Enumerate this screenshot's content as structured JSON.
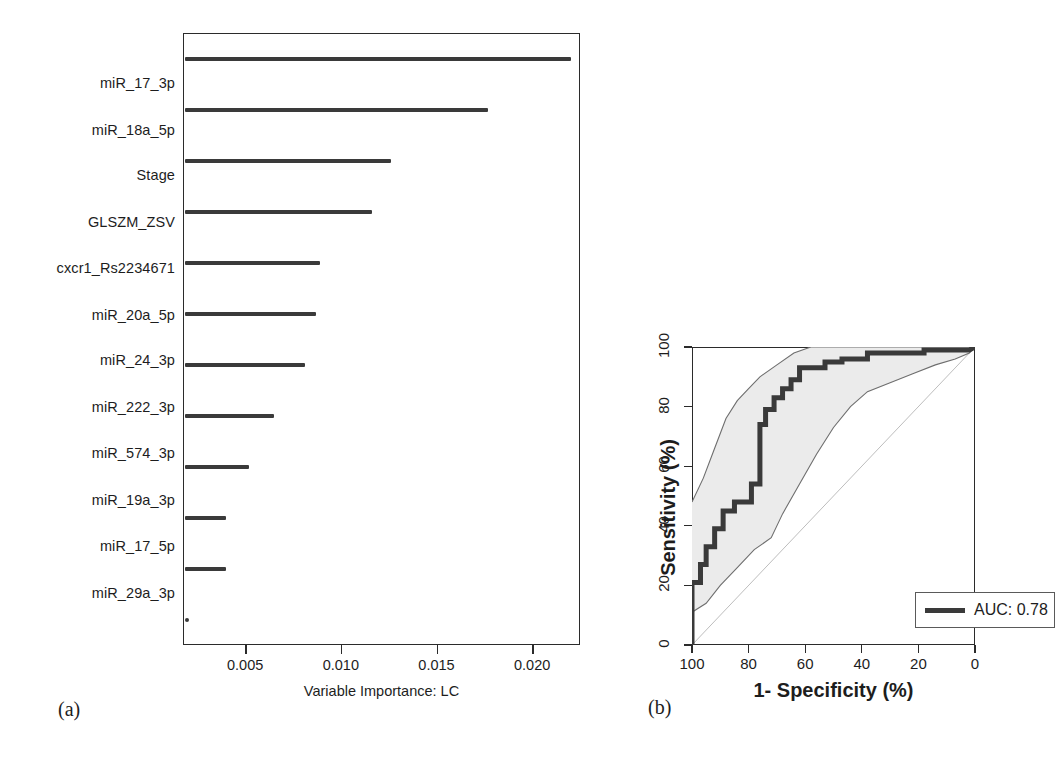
{
  "figure": {
    "caption_a": "(a)",
    "caption_b": "(b)"
  },
  "chart_data": [
    {
      "type": "bar",
      "orientation": "horizontal",
      "title": "",
      "xlabel": "Variable Importance: LC",
      "ylabel": "",
      "xlim": [
        0.00175,
        0.0225
      ],
      "xticks": [
        "0.005",
        "0.010",
        "0.015",
        "0.020"
      ],
      "xtick_values": [
        0.005,
        0.01,
        0.015,
        0.02
      ],
      "grid": false,
      "legend": "none",
      "categories": [
        "miR_17_3p",
        "miR_18a_5p",
        "Stage",
        "GLSZM_ZSV",
        "cxcr1_Rs2234671",
        "miR_20a_5p",
        "miR_24_3p",
        "miR_222_3p",
        "miR_574_3p",
        "miR_19a_3p",
        "miR_17_5p",
        "miR_29a_3p"
      ],
      "values": [
        0.0219,
        0.0176,
        0.0125,
        0.0115,
        0.0088,
        0.0086,
        0.008,
        0.0064,
        0.0051,
        0.0039,
        0.0039,
        0.0019
      ]
    },
    {
      "type": "line",
      "subtype": "roc",
      "title": "",
      "xlabel": "1- Specificity (%)",
      "ylabel": "Sensitivity (%)",
      "xlim": [
        100,
        0
      ],
      "ylim": [
        0,
        100
      ],
      "xticks": [
        "100",
        "80",
        "60",
        "40",
        "20",
        "0"
      ],
      "xtick_values": [
        100,
        80,
        60,
        40,
        20,
        0
      ],
      "yticks": [
        "100",
        "80",
        "60",
        "40",
        "20",
        "0"
      ],
      "ytick_values": [
        100,
        80,
        60,
        40,
        20,
        0
      ],
      "grid": false,
      "legend_position": "bottom-right",
      "legend_entries": [
        "AUC: 0.78"
      ],
      "auc": "0.78",
      "series": [
        {
          "name": "ROC curve",
          "points": [
            [
              100,
              0
            ],
            [
              100,
              21
            ],
            [
              97,
              21
            ],
            [
              97,
              27
            ],
            [
              95,
              27
            ],
            [
              95,
              33
            ],
            [
              92,
              33
            ],
            [
              92,
              39
            ],
            [
              89,
              39
            ],
            [
              89,
              45
            ],
            [
              85,
              45
            ],
            [
              85,
              48
            ],
            [
              79,
              48
            ],
            [
              79,
              54
            ],
            [
              76,
              54
            ],
            [
              76,
              74
            ],
            [
              74,
              74
            ],
            [
              74,
              79
            ],
            [
              71,
              79
            ],
            [
              71,
              83
            ],
            [
              68,
              83
            ],
            [
              68,
              86
            ],
            [
              65,
              86
            ],
            [
              65,
              89
            ],
            [
              62,
              89
            ],
            [
              62,
              93
            ],
            [
              53,
              93
            ],
            [
              53,
              95
            ],
            [
              47,
              95
            ],
            [
              47,
              96
            ],
            [
              38,
              96
            ],
            [
              38,
              98
            ],
            [
              18,
              98
            ],
            [
              18,
              99
            ],
            [
              2,
              99
            ],
            [
              0,
              100
            ]
          ]
        },
        {
          "name": "upper confidence bound",
          "points": [
            [
              100,
              48
            ],
            [
              96,
              56
            ],
            [
              92,
              66
            ],
            [
              88,
              76
            ],
            [
              84,
              82
            ],
            [
              80,
              86
            ],
            [
              76,
              90
            ],
            [
              70,
              94
            ],
            [
              64,
              98
            ],
            [
              58,
              100
            ],
            [
              40,
              100
            ],
            [
              20,
              100
            ],
            [
              0,
              100
            ]
          ]
        },
        {
          "name": "lower confidence bound",
          "points": [
            [
              100,
              0
            ],
            [
              100,
              11
            ],
            [
              95,
              14
            ],
            [
              90,
              20
            ],
            [
              84,
              26
            ],
            [
              78,
              32
            ],
            [
              72,
              36
            ],
            [
              68,
              44
            ],
            [
              62,
              54
            ],
            [
              56,
              64
            ],
            [
              50,
              73
            ],
            [
              44,
              80
            ],
            [
              38,
              85
            ],
            [
              30,
              88
            ],
            [
              22,
              91
            ],
            [
              14,
              94
            ],
            [
              7,
              96
            ],
            [
              2,
              98
            ],
            [
              0,
              100
            ]
          ]
        },
        {
          "name": "chance diagonal",
          "points": [
            [
              100,
              0
            ],
            [
              0,
              100
            ]
          ]
        }
      ]
    }
  ],
  "colors": {
    "curve": "#3a3a3a",
    "band_fill": "#ebebeb",
    "band_line": "#707070",
    "diagonal": "#b4b4b4",
    "axis": "#2b2b2b",
    "bar": "#3a3a3a"
  }
}
